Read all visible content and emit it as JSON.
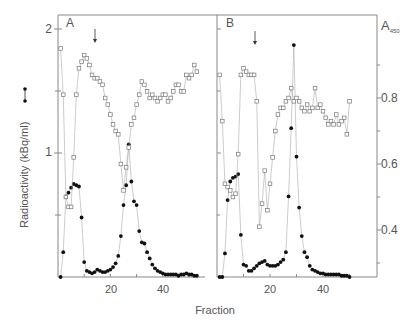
{
  "figure": {
    "xlabel": "Fraction",
    "ylabel_left": "Radioactivity (kBq/ml)",
    "ylabel_right_main": "A",
    "ylabel_right_sub": "450",
    "left_ticks": [
      "1",
      "2"
    ],
    "right_ticks": [
      "0.4",
      "0.6",
      "0.8"
    ],
    "x_ticks": [
      "20",
      "40"
    ],
    "colors": {
      "axis": "#888888",
      "filled": "#111111",
      "open": "#777777",
      "line": "#aaaaaa"
    }
  },
  "chart_data": [
    {
      "type": "line",
      "panel": "A",
      "title": "A",
      "xlabel": "Fraction",
      "ylabel": "Radioactivity (kBq/ml)",
      "ylabel_right": "A450",
      "xlim": [
        0,
        57
      ],
      "ylim_left": [
        0,
        2.1
      ],
      "ylim_right": [
        0.28,
        0.98
      ],
      "arrow_fraction": 14,
      "series": [
        {
          "name": "Radioactivity (kBq/ml)",
          "marker": "filled-circle",
          "axis": "left",
          "x": [
            1,
            2,
            3,
            4,
            5,
            6,
            7,
            8,
            9,
            10,
            11,
            12,
            13,
            14,
            15,
            16,
            17,
            18,
            19,
            20,
            21,
            22,
            23,
            24,
            25,
            26,
            27,
            28,
            29,
            30,
            31,
            32,
            33,
            34,
            35,
            36,
            37,
            38,
            39,
            40,
            41,
            42,
            43,
            44,
            45,
            46,
            47,
            48,
            49,
            50,
            51,
            52,
            53
          ],
          "values": [
            0.0,
            0.2,
            0.65,
            0.68,
            0.72,
            0.75,
            0.74,
            0.73,
            0.48,
            0.12,
            0.05,
            0.04,
            0.03,
            0.04,
            0.06,
            0.05,
            0.04,
            0.04,
            0.05,
            0.06,
            0.08,
            0.11,
            0.17,
            0.33,
            0.58,
            0.74,
            1.07,
            0.77,
            0.61,
            0.58,
            0.37,
            0.28,
            0.27,
            0.2,
            0.15,
            0.1,
            0.07,
            0.05,
            0.04,
            0.03,
            0.02,
            0.02,
            0.02,
            0.02,
            0.02,
            0.01,
            0.02,
            0.02,
            0.03,
            0.02,
            0.02,
            0.01,
            0.01
          ]
        },
        {
          "name": "A450",
          "marker": "open-square",
          "axis": "right",
          "x": [
            1,
            2,
            3,
            4,
            5,
            6,
            7,
            8,
            9,
            10,
            11,
            12,
            13,
            14,
            15,
            16,
            17,
            18,
            19,
            20,
            21,
            22,
            23,
            24,
            25,
            26,
            27,
            28,
            29,
            30,
            31,
            32,
            33,
            34,
            35,
            36,
            37,
            38,
            39,
            40,
            41,
            42,
            43,
            44,
            45,
            46,
            47,
            48,
            49,
            50,
            51,
            52,
            53
          ],
          "values": [
            0.95,
            0.81,
            0.5,
            0.47,
            0.47,
            0.62,
            0.81,
            0.89,
            0.91,
            0.93,
            0.92,
            0.9,
            0.87,
            0.86,
            0.86,
            0.85,
            0.84,
            0.8,
            0.78,
            0.75,
            0.72,
            0.7,
            0.69,
            0.6,
            0.52,
            0.59,
            0.65,
            0.72,
            0.74,
            0.78,
            0.81,
            0.85,
            0.84,
            0.82,
            0.8,
            0.81,
            0.8,
            0.79,
            0.8,
            0.81,
            0.81,
            0.79,
            0.8,
            0.82,
            0.84,
            0.84,
            0.82,
            0.82,
            0.87,
            0.86,
            0.87,
            0.9,
            0.88
          ]
        }
      ]
    },
    {
      "type": "line",
      "panel": "B",
      "title": "B",
      "xlabel": "Fraction",
      "ylabel": "Radioactivity (kBq/ml)",
      "ylabel_right": "A450",
      "xlim": [
        0,
        60
      ],
      "ylim_left": [
        0,
        2.1
      ],
      "ylim_right": [
        0.28,
        0.98
      ],
      "arrow_fraction": 14,
      "series": [
        {
          "name": "Radioactivity (kBq/ml)",
          "marker": "filled-circle",
          "axis": "left",
          "x": [
            1,
            2,
            3,
            4,
            5,
            6,
            7,
            8,
            9,
            10,
            11,
            12,
            13,
            14,
            15,
            16,
            17,
            18,
            19,
            20,
            21,
            22,
            23,
            24,
            25,
            26,
            27,
            28,
            29,
            30,
            31,
            32,
            33,
            34,
            35,
            36,
            37,
            38,
            39,
            40,
            41,
            42,
            43,
            44,
            45,
            46,
            47,
            48,
            49,
            50
          ],
          "values": [
            0.0,
            0.0,
            0.19,
            0.62,
            0.77,
            0.8,
            0.81,
            0.83,
            0.34,
            0.1,
            0.09,
            0.05,
            0.05,
            0.07,
            0.09,
            0.11,
            0.12,
            0.13,
            0.1,
            0.09,
            0.09,
            0.09,
            0.1,
            0.12,
            0.14,
            0.2,
            0.65,
            1.2,
            1.87,
            0.97,
            0.56,
            0.33,
            0.2,
            0.16,
            0.09,
            0.06,
            0.05,
            0.04,
            0.03,
            0.03,
            0.02,
            0.02,
            0.02,
            0.02,
            0.02,
            0.02,
            0.01,
            0.01,
            0.01,
            0.0
          ]
        },
        {
          "name": "A450",
          "marker": "open-square",
          "axis": "right",
          "x": [
            1,
            2,
            3,
            4,
            5,
            6,
            7,
            8,
            9,
            10,
            11,
            12,
            13,
            14,
            15,
            16,
            17,
            18,
            19,
            20,
            21,
            22,
            23,
            24,
            25,
            26,
            27,
            28,
            29,
            30,
            31,
            32,
            33,
            34,
            35,
            36,
            37,
            38,
            39,
            40,
            41,
            42,
            43,
            44,
            45,
            46,
            47,
            48,
            49,
            50
          ],
          "values": [
            0.87,
            0.73,
            0.54,
            0.53,
            0.52,
            0.5,
            0.51,
            0.63,
            0.87,
            0.89,
            0.88,
            0.87,
            0.87,
            0.87,
            0.79,
            0.41,
            0.48,
            0.58,
            0.46,
            0.54,
            0.62,
            0.7,
            0.75,
            0.77,
            0.77,
            0.79,
            0.8,
            0.83,
            0.79,
            0.8,
            0.79,
            0.77,
            0.76,
            0.78,
            0.76,
            0.77,
            0.83,
            0.77,
            0.78,
            0.76,
            0.74,
            0.72,
            0.73,
            0.72,
            0.75,
            0.72,
            0.73,
            0.74,
            0.69,
            0.79,
            0.8
          ],
          "note": "approximate readings"
        }
      ]
    }
  ]
}
